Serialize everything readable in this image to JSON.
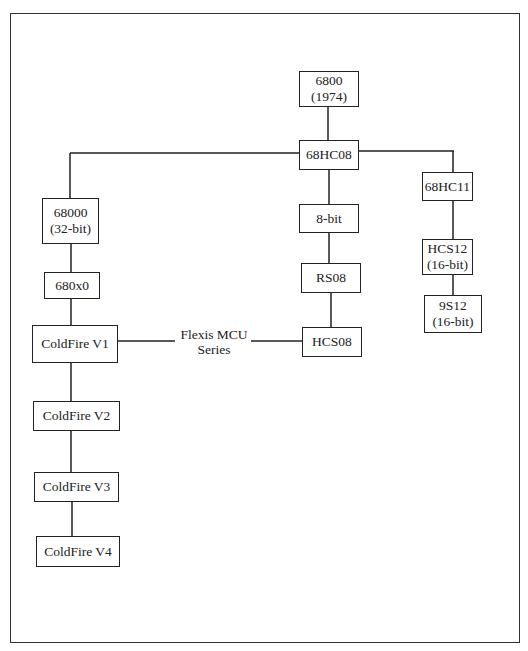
{
  "diagram": {
    "nodes": [
      {
        "id": "n6800",
        "line1": "6800",
        "line2": "(1974)"
      },
      {
        "id": "n68hc08",
        "line1": "68HC08",
        "line2": ""
      },
      {
        "id": "n68000",
        "line1": "68000",
        "line2": "(32-bit)"
      },
      {
        "id": "n680x0",
        "line1": "680x0",
        "line2": ""
      },
      {
        "id": "ncf1",
        "line1": "ColdFire V1",
        "line2": ""
      },
      {
        "id": "ncf2",
        "line1": "ColdFire V2",
        "line2": ""
      },
      {
        "id": "ncf3",
        "line1": "ColdFire V3",
        "line2": ""
      },
      {
        "id": "ncf4",
        "line1": "ColdFire V4",
        "line2": ""
      },
      {
        "id": "n8bit",
        "line1": "8-bit",
        "line2": ""
      },
      {
        "id": "nrs08",
        "line1": "RS08",
        "line2": ""
      },
      {
        "id": "nhcs08",
        "line1": "HCS08",
        "line2": ""
      },
      {
        "id": "n68hc11",
        "line1": "68HC11",
        "line2": ""
      },
      {
        "id": "nhcs12",
        "line1": "HCS12",
        "line2": "(16-bit)"
      },
      {
        "id": "n9s12",
        "line1": "9S12",
        "line2": "(16-bit)"
      }
    ],
    "edge_label": {
      "line1": "Flexis MCU",
      "line2": "Series"
    },
    "edges": [
      [
        "6800",
        "68HC08"
      ],
      [
        "68HC08",
        "68000"
      ],
      [
        "68HC08",
        "8-bit"
      ],
      [
        "68HC08",
        "68HC11"
      ],
      [
        "68000",
        "680x0"
      ],
      [
        "680x0",
        "ColdFire V1"
      ],
      [
        "ColdFire V1",
        "ColdFire V2"
      ],
      [
        "ColdFire V2",
        "ColdFire V3"
      ],
      [
        "ColdFire V3",
        "ColdFire V4"
      ],
      [
        "8-bit",
        "RS08"
      ],
      [
        "RS08",
        "HCS08"
      ],
      [
        "ColdFire V1",
        "HCS08"
      ],
      [
        "68HC11",
        "HCS12"
      ],
      [
        "HCS12",
        "9S12"
      ]
    ],
    "colors": {
      "line": "#222222",
      "background": "#ffffff"
    }
  }
}
